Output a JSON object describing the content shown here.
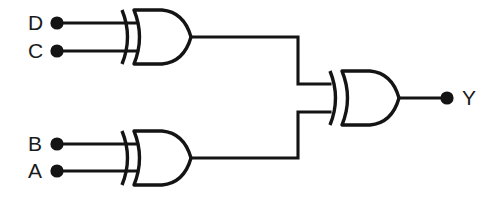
{
  "diagram": {
    "background_color": "#ffffff",
    "line_color": "#141414"
  },
  "labels": {
    "input_d": "D",
    "input_c": "C",
    "input_b": "B",
    "input_a": "A",
    "output_y": "Y"
  },
  "gates": [
    {
      "id": "gate-top",
      "type": "XOR",
      "inputs": [
        "D",
        "C"
      ],
      "output": "net1"
    },
    {
      "id": "gate-bottom",
      "type": "XOR",
      "inputs": [
        "B",
        "A"
      ],
      "output": "net2"
    },
    {
      "id": "gate-output",
      "type": "XOR",
      "inputs": [
        "net1",
        "net2"
      ],
      "output": "Y"
    }
  ],
  "terminals": [
    {
      "name": "D",
      "kind": "input"
    },
    {
      "name": "C",
      "kind": "input"
    },
    {
      "name": "B",
      "kind": "input"
    },
    {
      "name": "A",
      "kind": "input"
    },
    {
      "name": "Y",
      "kind": "output"
    }
  ]
}
